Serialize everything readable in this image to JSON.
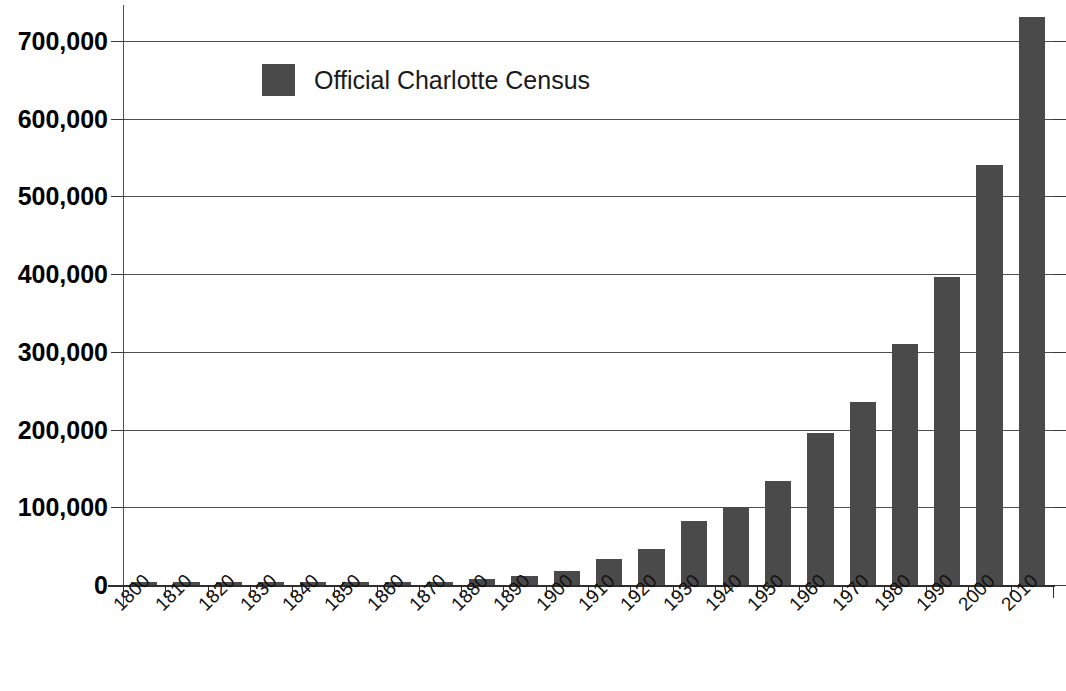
{
  "chart_data": {
    "type": "bar",
    "title": "",
    "xlabel": "",
    "ylabel": "",
    "legend": [
      "Official Charlotte Census"
    ],
    "legend_position": "inside-top-left",
    "grid": true,
    "grid_axis": "y",
    "ylim": [
      0,
      700000
    ],
    "ytick_labels": [
      "0",
      "100,000",
      "200,000",
      "300,000",
      "400,000",
      "500,000",
      "600,000",
      "700,000"
    ],
    "ytick_values": [
      0,
      100000,
      200000,
      300000,
      400000,
      500000,
      600000,
      700000
    ],
    "bar_color": "#4a4a4a",
    "categories": [
      "1800",
      "1810",
      "1820",
      "1830",
      "1840",
      "1850",
      "1860",
      "1870",
      "1880",
      "1890",
      "1900",
      "1910",
      "1920",
      "1930",
      "1940",
      "1950",
      "1960",
      "1970",
      "1980",
      "1990",
      "2000",
      "2010"
    ],
    "series": [
      {
        "name": "Official Charlotte Census",
        "values": [
          2000,
          2200,
          2400,
          2600,
          2800,
          3000,
          2300,
          4500,
          7100,
          11600,
          18100,
          34000,
          46000,
          82000,
          100000,
          134000,
          196000,
          236000,
          310000,
          396000,
          541000,
          731000
        ]
      }
    ]
  },
  "legend": {
    "swatch_name": "legend-color-swatch",
    "label": "Official Charlotte Census"
  },
  "axis": {
    "y_labels": [
      "700,000",
      "600,000",
      "500,000",
      "400,000",
      "300,000",
      "200,000",
      "100,000",
      "0"
    ],
    "x_labels": [
      "1800",
      "1810",
      "1820",
      "1830",
      "1840",
      "1850",
      "1860",
      "1870",
      "1880",
      "1890",
      "1900",
      "1910",
      "1920",
      "1930",
      "1940",
      "1950",
      "1960",
      "1970",
      "1980",
      "1990",
      "2000",
      "2010"
    ]
  }
}
